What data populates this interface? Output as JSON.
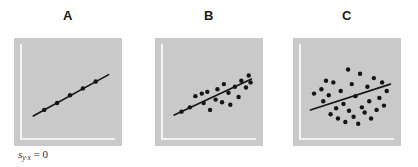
{
  "figure": {
    "background_color": "#ffffff",
    "panel_background_color": "#c9c9c9",
    "axis_color": "#ffffff",
    "line_color": "#151515",
    "point_color": "#141414",
    "width": 418,
    "height": 167
  },
  "annotation": {
    "symbol": "s",
    "subscript": "y·x",
    "equals": " = 0",
    "full_text": "s y·x = 0"
  },
  "panels": [
    {
      "letter": "A",
      "description": "perfect linear relationship, all points on the regression line",
      "chart_data": {
        "type": "scatter",
        "title": "A",
        "xlabel": "",
        "ylabel": "",
        "xlim": [
          0,
          100
        ],
        "ylim": [
          0,
          100
        ],
        "grid": false,
        "legend": "none",
        "points": [
          [
            22,
            28
          ],
          [
            36,
            36
          ],
          [
            50,
            45
          ],
          [
            64,
            53
          ],
          [
            78,
            61
          ]
        ],
        "regression_line": {
          "x1": 10,
          "y1": 21,
          "x2": 92,
          "y2": 69
        }
      }
    },
    {
      "letter": "B",
      "description": "moderate scatter about the regression line",
      "chart_data": {
        "type": "scatter",
        "title": "B",
        "xlabel": "",
        "ylabel": "",
        "xlim": [
          0,
          100
        ],
        "ylim": [
          0,
          100
        ],
        "grid": false,
        "legend": "none",
        "points": [
          [
            18,
            26
          ],
          [
            27,
            31
          ],
          [
            33,
            44
          ],
          [
            40,
            47
          ],
          [
            46,
            49
          ],
          [
            42,
            36
          ],
          [
            49,
            28
          ],
          [
            55,
            40
          ],
          [
            57,
            52
          ],
          [
            62,
            37
          ],
          [
            64,
            58
          ],
          [
            69,
            48
          ],
          [
            71,
            34
          ],
          [
            76,
            55
          ],
          [
            80,
            43
          ],
          [
            83,
            62
          ],
          [
            88,
            54
          ],
          [
            91,
            68
          ],
          [
            93,
            60
          ]
        ],
        "regression_line": {
          "x1": 10,
          "y1": 22,
          "x2": 94,
          "y2": 64
        }
      }
    },
    {
      "letter": "C",
      "description": "wide scatter about the regression line, weak relationship",
      "chart_data": {
        "type": "scatter",
        "title": "C",
        "xlabel": "",
        "ylabel": "",
        "xlim": [
          0,
          100
        ],
        "ylim": [
          0,
          100
        ],
        "grid": false,
        "legend": "none",
        "points": [
          [
            12,
            47
          ],
          [
            20,
            52
          ],
          [
            22,
            38
          ],
          [
            25,
            62
          ],
          [
            28,
            45
          ],
          [
            30,
            23
          ],
          [
            33,
            60
          ],
          [
            36,
            30
          ],
          [
            38,
            18
          ],
          [
            41,
            50
          ],
          [
            44,
            35
          ],
          [
            46,
            14
          ],
          [
            49,
            75
          ],
          [
            50,
            27
          ],
          [
            53,
            58
          ],
          [
            55,
            20
          ],
          [
            57,
            44
          ],
          [
            60,
            12
          ],
          [
            62,
            70
          ],
          [
            64,
            31
          ],
          [
            67,
            25
          ],
          [
            70,
            55
          ],
          [
            72,
            38
          ],
          [
            74,
            18
          ],
          [
            77,
            65
          ],
          [
            80,
            28
          ],
          [
            83,
            42
          ],
          [
            86,
            60
          ],
          [
            88,
            33
          ],
          [
            91,
            50
          ]
        ],
        "regression_line": {
          "x1": 8,
          "y1": 28,
          "x2": 95,
          "y2": 58
        }
      }
    }
  ]
}
